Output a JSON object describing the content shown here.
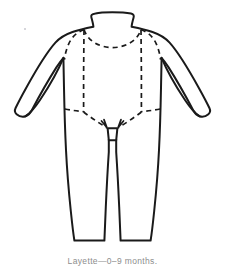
{
  "figure": {
    "caption": "Layette—0–9 months.",
    "background_color": "#ffffff",
    "outline_color": "#1a1a1a",
    "stitch_line_color": "#1a1a1a",
    "caption_color": "#8d8d8d"
  },
  "garment": {
    "name": "layette",
    "parts": [
      {
        "name": "collar",
        "label": "collar"
      },
      {
        "name": "left-sleeve",
        "label": "left sleeve"
      },
      {
        "name": "right-sleeve",
        "label": "right sleeve"
      },
      {
        "name": "left-cuff",
        "label": "left cuff"
      },
      {
        "name": "right-cuff",
        "label": "right cuff"
      },
      {
        "name": "bodice",
        "label": "bodice"
      },
      {
        "name": "left-leg",
        "label": "left leg"
      },
      {
        "name": "right-leg",
        "label": "right leg"
      },
      {
        "name": "crotch-gusset",
        "label": "crotch gusset"
      },
      {
        "name": "left-leg-hem",
        "label": "left leg hem"
      },
      {
        "name": "right-leg-hem",
        "label": "right leg hem"
      }
    ],
    "stitching": [
      {
        "name": "neckline-seam",
        "label": "neckline stitch line"
      },
      {
        "name": "left-placket-seam",
        "label": "left placket stitch line"
      },
      {
        "name": "right-placket-seam",
        "label": "right placket stitch line"
      },
      {
        "name": "left-armhole-seam",
        "label": "left armhole stitch line"
      },
      {
        "name": "right-armhole-seam",
        "label": "right armhole stitch line"
      },
      {
        "name": "left-hip-seam",
        "label": "left hip stitch line"
      },
      {
        "name": "right-hip-seam",
        "label": "right hip stitch line"
      },
      {
        "name": "left-crotch-seam",
        "label": "left crotch stitch line"
      },
      {
        "name": "right-crotch-seam",
        "label": "right crotch stitch line"
      }
    ]
  }
}
